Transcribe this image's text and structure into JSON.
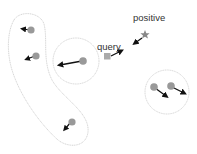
{
  "labels": {
    "positive": "positive",
    "query": "query"
  },
  "colors": {
    "point": "#999999",
    "query": "#aaaaaa",
    "positive": "#888888",
    "arrow": "#111111",
    "boundary": "#cccccc",
    "text": "#333333"
  },
  "groups": [
    {
      "name": "elongated-cluster",
      "points": 3
    },
    {
      "name": "single-point-cluster",
      "points": 1
    },
    {
      "name": "pair-cluster",
      "points": 2
    }
  ]
}
